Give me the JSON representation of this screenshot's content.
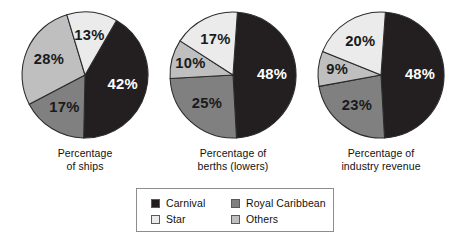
{
  "chart_data": {
    "type": "pie",
    "title": "",
    "legend_position": "bottom-center",
    "series_names": [
      "Carnival",
      "Star",
      "Royal Caribbean",
      "Others"
    ],
    "colors": {
      "Carnival": "#231f20",
      "Star": "#ebebeb",
      "Royal Caribbean": "#808080",
      "Others": "#bfbfbf"
    },
    "charts": [
      {
        "caption_lines": [
          "Percentage",
          "of ships"
        ],
        "caption": "Percentage of ships",
        "start_angle": -60,
        "slices": [
          {
            "name": "Carnival",
            "value": 42,
            "label": "42%"
          },
          {
            "name": "Royal Caribbean",
            "value": 17,
            "label": "17%"
          },
          {
            "name": "Others",
            "value": 28,
            "label": "28%"
          },
          {
            "name": "Star",
            "value": 13,
            "label": "13%"
          }
        ]
      },
      {
        "caption_lines": [
          "Percentage of",
          "berths (lowers)"
        ],
        "caption": "Percentage of berths (lowers)",
        "start_angle": -86,
        "slices": [
          {
            "name": "Carnival",
            "value": 48,
            "label": "48%"
          },
          {
            "name": "Royal Caribbean",
            "value": 25,
            "label": "25%"
          },
          {
            "name": "Others",
            "value": 10,
            "label": "10%"
          },
          {
            "name": "Star",
            "value": 17,
            "label": "17%"
          }
        ]
      },
      {
        "caption_lines": [
          "Percentage of",
          "industry revenue"
        ],
        "caption": "Percentage of industry revenue",
        "start_angle": -86,
        "slices": [
          {
            "name": "Carnival",
            "value": 48,
            "label": "48%"
          },
          {
            "name": "Royal Caribbean",
            "value": 23,
            "label": "23%"
          },
          {
            "name": "Others",
            "value": 9,
            "label": "9%"
          },
          {
            "name": "Star",
            "value": 20,
            "label": "20%"
          }
        ]
      }
    ],
    "legend": [
      {
        "label": "Carnival",
        "color": "#231f20"
      },
      {
        "label": "Royal Caribbean",
        "color": "#808080"
      },
      {
        "label": "Star",
        "color": "#ebebeb"
      },
      {
        "label": "Others",
        "color": "#bfbfbf"
      }
    ]
  }
}
